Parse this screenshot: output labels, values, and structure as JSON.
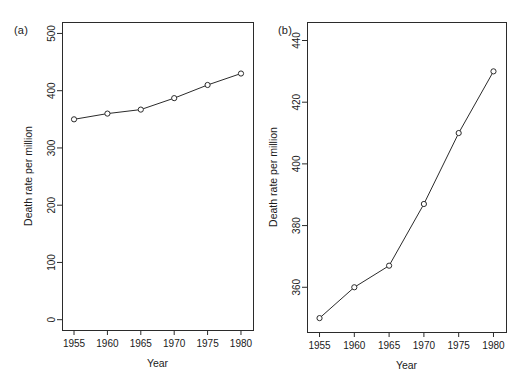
{
  "figure": {
    "background": "#ffffff",
    "ink": "#2b2b2b"
  },
  "panels": [
    {
      "id": "a",
      "label": "(a)"
    },
    {
      "id": "b",
      "label": "(b)"
    }
  ],
  "chart_data": [
    {
      "type": "line",
      "panel": "(a)",
      "title": "",
      "xlabel": "Year",
      "ylabel": "Death rate per million",
      "x": [
        1955,
        1960,
        1965,
        1970,
        1975,
        1980
      ],
      "values": [
        350,
        360,
        367,
        387,
        410,
        430
      ],
      "xticks": [
        1955,
        1960,
        1965,
        1970,
        1975,
        1980
      ],
      "xticklabels": [
        "1955",
        "1960",
        "1965",
        "1970",
        "1975",
        "1980"
      ],
      "yticks": [
        0,
        100,
        200,
        300,
        400,
        500
      ],
      "yticklabels": [
        "0",
        "100",
        "200",
        "300",
        "400",
        "500"
      ],
      "xlim": [
        1953.2,
        1981.8
      ],
      "ylim": [
        -18,
        520
      ],
      "grid": false,
      "legend": null,
      "marker": "open-circle"
    },
    {
      "type": "line",
      "panel": "(b)",
      "title": "",
      "xlabel": "Year",
      "ylabel": "Death rate per million",
      "x": [
        1955,
        1960,
        1965,
        1970,
        1975,
        1980
      ],
      "values": [
        350,
        360,
        367,
        387,
        410,
        430
      ],
      "xticks": [
        1955,
        1960,
        1965,
        1970,
        1975,
        1980
      ],
      "xticklabels": [
        "1955",
        "1960",
        "1965",
        "1970",
        "1975",
        "1980"
      ],
      "yticks": [
        360,
        380,
        400,
        420,
        440
      ],
      "yticklabels": [
        "360",
        "380",
        "400",
        "420",
        "440"
      ],
      "xlim": [
        1953.2,
        1981.8
      ],
      "ylim": [
        345.5,
        446
      ],
      "grid": false,
      "legend": null,
      "marker": "open-circle"
    }
  ]
}
